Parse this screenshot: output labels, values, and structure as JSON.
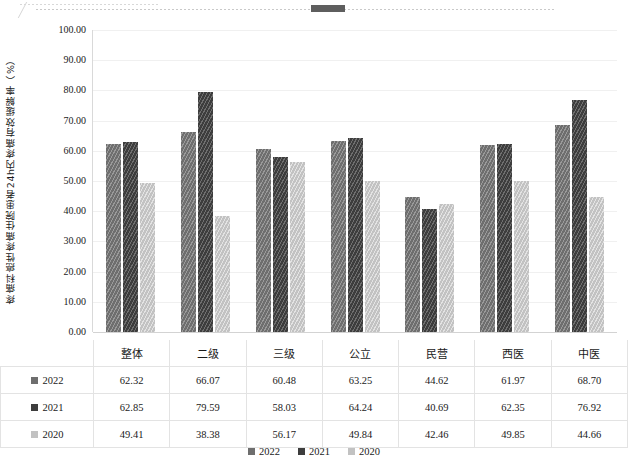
{
  "chart_data": {
    "type": "bar",
    "title": "",
    "xlabel": "",
    "ylabel": "疼痛科癌性疼痛住院患者24h内疼痛有效缓解率（%）",
    "ylim": [
      0,
      100
    ],
    "ytick_labels": [
      "100.00",
      "90.00",
      "80.00",
      "70.00",
      "60.00",
      "50.00",
      "40.00",
      "30.00",
      "20.00",
      "10.00",
      "0.00"
    ],
    "ytick_values": [
      100,
      90,
      80,
      70,
      60,
      50,
      40,
      30,
      20,
      10,
      0
    ],
    "grid": true,
    "legend_position": "bottom",
    "categories": [
      "整体",
      "二级",
      "三级",
      "公立",
      "民营",
      "西医",
      "中医"
    ],
    "series": [
      {
        "name": "2022",
        "color": "#6e6e6e",
        "values": [
          62.32,
          66.07,
          60.48,
          63.25,
          44.62,
          61.97,
          68.7
        ],
        "labels": [
          "62.32",
          "66.07",
          "60.48",
          "63.25",
          "44.62",
          "61.97",
          "68.70"
        ]
      },
      {
        "name": "2021",
        "color": "#3d3d3d",
        "values": [
          62.85,
          79.59,
          58.03,
          64.24,
          40.69,
          62.35,
          76.92
        ],
        "labels": [
          "62.85",
          "79.59",
          "58.03",
          "64.24",
          "40.69",
          "62.35",
          "76.92"
        ]
      },
      {
        "name": "2020",
        "color": "#c2c2c2",
        "values": [
          49.41,
          38.38,
          56.17,
          49.84,
          42.46,
          49.85,
          44.66
        ],
        "labels": [
          "49.41",
          "38.38",
          "56.17",
          "49.84",
          "42.46",
          "49.85",
          "44.66"
        ]
      }
    ]
  },
  "legend": {
    "items": [
      {
        "label": "2022",
        "color": "#6e6e6e"
      },
      {
        "label": "2021",
        "color": "#3d3d3d"
      },
      {
        "label": "2020",
        "color": "#c2c2c2"
      }
    ]
  },
  "table": {
    "row_labels": [
      "2022",
      "2021",
      "2020"
    ]
  }
}
